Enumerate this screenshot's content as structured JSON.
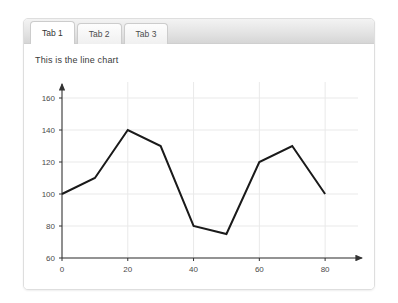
{
  "panel": {
    "tabs": [
      {
        "label": "Tab 1",
        "active": true
      },
      {
        "label": "Tab 2",
        "active": false
      },
      {
        "label": "Tab 3",
        "active": false
      }
    ]
  },
  "content": {
    "title": "This is the line chart"
  },
  "chart_data": {
    "type": "line",
    "title": "This is the line chart",
    "xlabel": "",
    "ylabel": "",
    "x": [
      0,
      10,
      20,
      30,
      40,
      50,
      60,
      70,
      80
    ],
    "values": [
      100,
      110,
      140,
      130,
      80,
      75,
      120,
      130,
      100
    ],
    "series": [
      {
        "name": "series-1",
        "values": [
          100,
          110,
          140,
          130,
          80,
          75,
          120,
          130,
          100
        ],
        "color": "#1a1a1a"
      }
    ],
    "xticks": [
      0,
      20,
      40,
      60,
      80
    ],
    "yticks": [
      60,
      80,
      100,
      120,
      140,
      160
    ],
    "xlim": [
      0,
      90
    ],
    "ylim": [
      60,
      170
    ],
    "grid": true,
    "grid_color": "#e9e9e9",
    "axis_color": "#333333",
    "legend": "none",
    "markers": false,
    "arrow_axes": true
  }
}
